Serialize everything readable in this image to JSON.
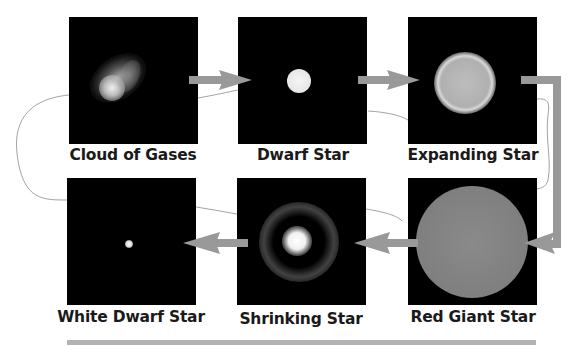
{
  "diagram": {
    "stages": [
      {
        "id": "cloud",
        "label": "Cloud of Gases"
      },
      {
        "id": "dwarf",
        "label": "Dwarf Star"
      },
      {
        "id": "expanding",
        "label": "Expanding Star"
      },
      {
        "id": "red-giant",
        "label": "Red Giant Star"
      },
      {
        "id": "shrinking",
        "label": "Shrinking Star"
      },
      {
        "id": "white-dwarf",
        "label": "White Dwarf Star"
      }
    ],
    "flow": [
      "Cloud of Gases",
      "Dwarf Star",
      "Expanding Star",
      "Red Giant Star",
      "Shrinking Star",
      "White Dwarf Star"
    ],
    "colors": {
      "panel": "#000000",
      "arrow": "#999999",
      "footer_bar": "#b3b3b3",
      "label": "#1a1a1a",
      "pencil_line": "#7a7a7a"
    }
  }
}
